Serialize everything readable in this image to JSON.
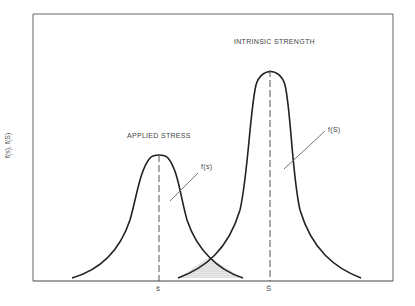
{
  "diagram": {
    "type": "stress-strength-interference",
    "y_axis_label": "f(s), f(S)",
    "curves": [
      {
        "name": "applied-stress",
        "title": "APPLIED STRESS",
        "pdf_label": "f(s)",
        "mean_label": "s̄"
      },
      {
        "name": "intrinsic-strength",
        "title": "INTRINSIC STRENGTH",
        "pdf_label": "f(S)",
        "mean_label": "S̄"
      }
    ],
    "overlap_region": "interference (shaded)"
  }
}
